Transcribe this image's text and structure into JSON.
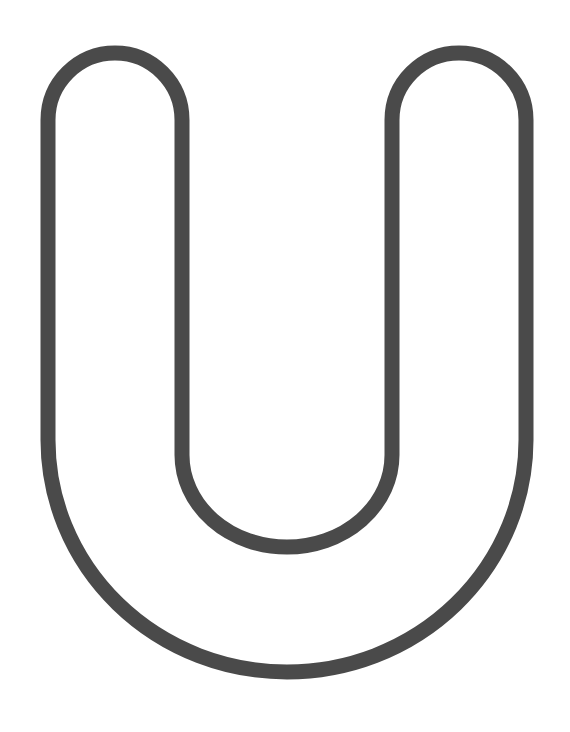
{
  "figure": {
    "letter": "U",
    "style": "outline",
    "stroke_color": "#4a4a4a",
    "fill_color": "#ffffff",
    "background": "#ffffff"
  }
}
